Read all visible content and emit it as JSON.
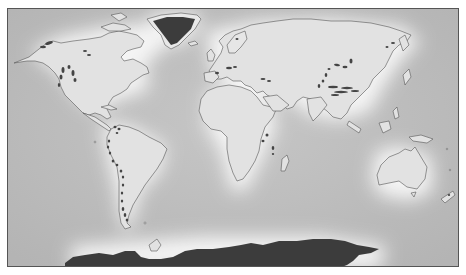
{
  "map": {
    "type": "world-map",
    "projection": "equirectangular-like",
    "style": "grayscale with glow around landmasses",
    "colors": {
      "ocean": "#bdbdbd",
      "land": "#e3e3e3",
      "coast_glow": "#f7f7f7",
      "coastline": "#555555",
      "ice_sheet": "#3c3c3c",
      "glacier_marker": "#444444",
      "frame": "#555555"
    },
    "ice_sheets": [
      "Greenland",
      "Antarctica"
    ],
    "glacier_regions": [
      "Alaska",
      "Canadian Rockies",
      "Canadian Arctic",
      "Andes (north)",
      "Andes (central)",
      "Patagonia",
      "Alps",
      "Pyrenees",
      "Caucasus",
      "Tian Shan",
      "Pamir",
      "Himalaya",
      "Karakoram",
      "East Africa",
      "Scandinavia",
      "Iceland",
      "New Zealand",
      "Kamchatka"
    ],
    "labels": []
  }
}
